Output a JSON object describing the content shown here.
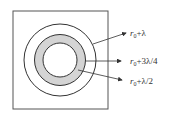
{
  "diagram": {
    "type": "concentric-rings-in-square",
    "colors": {
      "stroke": "#333333",
      "ring_fill": "#d4d4d4",
      "background": "#ffffff"
    },
    "labels": [
      {
        "id": "outer",
        "var": "r",
        "sub": "0",
        "rest": "+λ"
      },
      {
        "id": "middle",
        "var": "r",
        "sub": "0",
        "rest": "+3λ/4"
      },
      {
        "id": "inner",
        "var": "r",
        "sub": "0",
        "rest": "+λ/2"
      }
    ]
  }
}
